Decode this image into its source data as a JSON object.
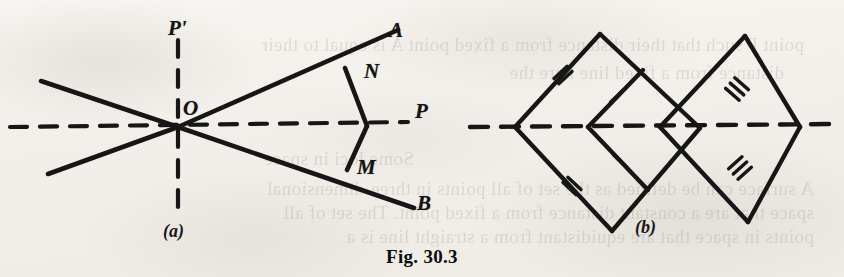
{
  "figure": {
    "caption": "Fig. 30.3",
    "page_background": "#f4f2ee",
    "ink_color": "#141414"
  },
  "parts": [
    {
      "key": "a",
      "label": "(a)",
      "x": 163,
      "y": 222
    },
    {
      "key": "b",
      "label": "(b)",
      "x": 635,
      "y": 218
    }
  ],
  "diagram_a": {
    "name": "angle-bisector-construction",
    "vertex": {
      "label": "O",
      "x": 178,
      "y": 127,
      "label_x": 183,
      "label_y": 98
    },
    "point_labels": [
      {
        "label": "P'",
        "x": 168,
        "y": 18,
        "name": "label-p-prime"
      },
      {
        "label": "A",
        "x": 389,
        "y": 20,
        "name": "label-a"
      },
      {
        "label": "N",
        "x": 364,
        "y": 61,
        "name": "label-n"
      },
      {
        "label": "P",
        "x": 415,
        "y": 101,
        "name": "label-p"
      },
      {
        "label": "M",
        "x": 357,
        "y": 157,
        "name": "label-m"
      },
      {
        "label": "B",
        "x": 417,
        "y": 193,
        "name": "label-b"
      }
    ],
    "solid_lines": [
      {
        "name": "ray-oa",
        "x1": 178,
        "y1": 127,
        "x2": 398,
        "y2": 30
      },
      {
        "name": "ray-ob",
        "x1": 178,
        "y1": 127,
        "x2": 414,
        "y2": 208
      },
      {
        "name": "ray-o-upper-left",
        "x1": 178,
        "y1": 127,
        "x2": 41,
        "y2": 81
      },
      {
        "name": "ray-o-lower-left",
        "x1": 178,
        "y1": 127,
        "x2": 48,
        "y2": 174
      },
      {
        "name": "segment-n-to-axis",
        "x1": 345,
        "y1": 68,
        "x2": 367,
        "y2": 126
      },
      {
        "name": "segment-axis-to-m",
        "x1": 367,
        "y1": 126,
        "x2": 347,
        "y2": 170
      }
    ],
    "dashed_lines": [
      {
        "name": "axis-op",
        "x1": 10,
        "y1": 127,
        "x2": 408,
        "y2": 122
      },
      {
        "name": "perpendicular-op-prime",
        "x1": 178,
        "y1": 40,
        "x2": 178,
        "y2": 211
      }
    ]
  },
  "diagram_b": {
    "name": "rhombus-congruence-construction",
    "axis": {
      "name": "axis-dashed",
      "x1": 470,
      "y1": 127,
      "x2": 838,
      "y2": 124
    },
    "solid_lines": [
      {
        "name": "left-rhombus-upper-left",
        "x1": 515,
        "y1": 127,
        "x2": 600,
        "y2": 34
      },
      {
        "name": "left-rhombus-lower-right",
        "x1": 600,
        "y1": 34,
        "x2": 700,
        "y2": 128
      },
      {
        "name": "left-rhombus-lower-left",
        "x1": 515,
        "y1": 127,
        "x2": 612,
        "y2": 231
      },
      {
        "name": "left-rhombus-upper-right",
        "x1": 612,
        "y1": 231,
        "x2": 700,
        "y2": 128
      },
      {
        "name": "inner-kite-upper",
        "x1": 588,
        "y1": 127,
        "x2": 643,
        "y2": 70
      },
      {
        "name": "inner-kite-lower",
        "x1": 588,
        "y1": 127,
        "x2": 648,
        "y2": 190
      },
      {
        "name": "right-rhombus-upper-left",
        "x1": 660,
        "y1": 127,
        "x2": 745,
        "y2": 36
      },
      {
        "name": "right-rhombus-lower-right",
        "x1": 745,
        "y1": 36,
        "x2": 800,
        "y2": 127
      },
      {
        "name": "right-rhombus-lower-left",
        "x1": 660,
        "y1": 127,
        "x2": 748,
        "y2": 222
      },
      {
        "name": "right-rhombus-upper-right",
        "x1": 748,
        "y1": 222,
        "x2": 800,
        "y2": 127
      }
    ],
    "tick_marks": [
      {
        "name": "tick-double-upper-left",
        "x": 563,
        "y": 75,
        "count": 2,
        "angle": 47
      },
      {
        "name": "tick-double-lower-left",
        "x": 572,
        "y": 186,
        "count": 2,
        "angle": -47
      },
      {
        "name": "tick-single-inner-upper",
        "x": 617,
        "y": 96,
        "count": 1,
        "angle": 46
      },
      {
        "name": "tick-single-inner-lower",
        "x": 620,
        "y": 161,
        "count": 1,
        "angle": -46
      },
      {
        "name": "tick-triple-upper-right",
        "x": 737,
        "y": 89,
        "count": 3,
        "angle": -49
      },
      {
        "name": "tick-triple-lower-right",
        "x": 740,
        "y": 168,
        "count": 3,
        "angle": 48
      }
    ],
    "vertices_on_axis": [
      515,
      588,
      660,
      745
    ]
  },
  "bleed_text": [
    {
      "text": "point P such that their distance from a fixed point A is equal to their",
      "x": 40,
      "y": 34
    },
    {
      "text": "distance from a fixed line l are the",
      "x": 60,
      "y": 62
    },
    {
      "text": "Some loci in space",
      "x": 430,
      "y": 148
    },
    {
      "text": "A surface can be defined as the set of all points in three-dimensional",
      "x": 30,
      "y": 178
    },
    {
      "text": "space that are a constant distance from a fixed point. The set of all",
      "x": 30,
      "y": 202
    },
    {
      "text": "points in space that are equidistant from a straight line is a",
      "x": 30,
      "y": 226
    }
  ]
}
